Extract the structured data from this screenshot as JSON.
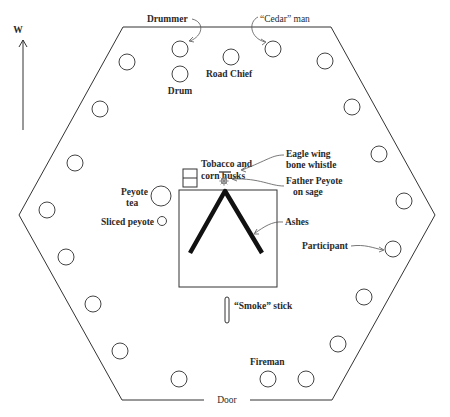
{
  "diagram": {
    "compass": {
      "label": "W",
      "direction": "up"
    },
    "labels": {
      "drummer": "Drummer",
      "cedar_man": "“Cedar” man",
      "drum": "Drum",
      "road_chief": "Road Chief",
      "tobacco_1": "Tobacco and",
      "tobacco_2": "corn husks",
      "eagle_1": "Eagle wing",
      "eagle_2": "bone whistle",
      "father_1": "Father Peyote",
      "father_2": "on sage",
      "peyote_tea_1": "Peyote",
      "peyote_tea_2": "tea",
      "sliced_peyote": "Sliced peyote",
      "ashes": "Ashes",
      "participant": "Participant",
      "smoke_stick": "“Smoke” stick",
      "fireman": "Fireman",
      "door": "Door"
    },
    "participant_count": 18,
    "colors": {
      "line": "#333333",
      "ashes": "#111111",
      "background": "#ffffff"
    }
  }
}
